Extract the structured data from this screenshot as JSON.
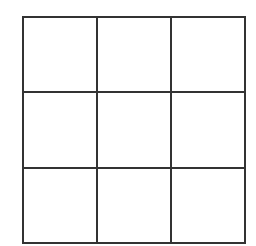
{
  "grid": {
    "rows": 3,
    "columns": 3,
    "line_color": "#333333",
    "cell_color": "#ffffff",
    "cells": [
      {
        "row": 1,
        "col": 1,
        "content": ""
      },
      {
        "row": 1,
        "col": 2,
        "content": ""
      },
      {
        "row": 1,
        "col": 3,
        "content": ""
      },
      {
        "row": 2,
        "col": 1,
        "content": ""
      },
      {
        "row": 2,
        "col": 2,
        "content": ""
      },
      {
        "row": 2,
        "col": 3,
        "content": ""
      },
      {
        "row": 3,
        "col": 1,
        "content": ""
      },
      {
        "row": 3,
        "col": 2,
        "content": ""
      },
      {
        "row": 3,
        "col": 3,
        "content": ""
      }
    ]
  }
}
